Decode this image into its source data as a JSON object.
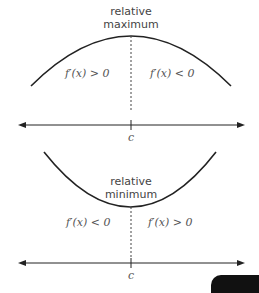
{
  "diagrams": [
    {
      "name": "relative-maximum",
      "label_line1": "relative",
      "label_line2": "maximum",
      "left_region": "f′(x) > 0",
      "right_region": "f′(x) < 0",
      "axis_point": "c"
    },
    {
      "name": "relative-minimum",
      "label_line1": "relative",
      "label_line2": "minimum",
      "left_region": "f′(x) < 0",
      "right_region": "f′(x) > 0",
      "axis_point": "c"
    }
  ],
  "colors": {
    "curve": "#222222",
    "text": "#444444",
    "background": "#ffffff"
  }
}
